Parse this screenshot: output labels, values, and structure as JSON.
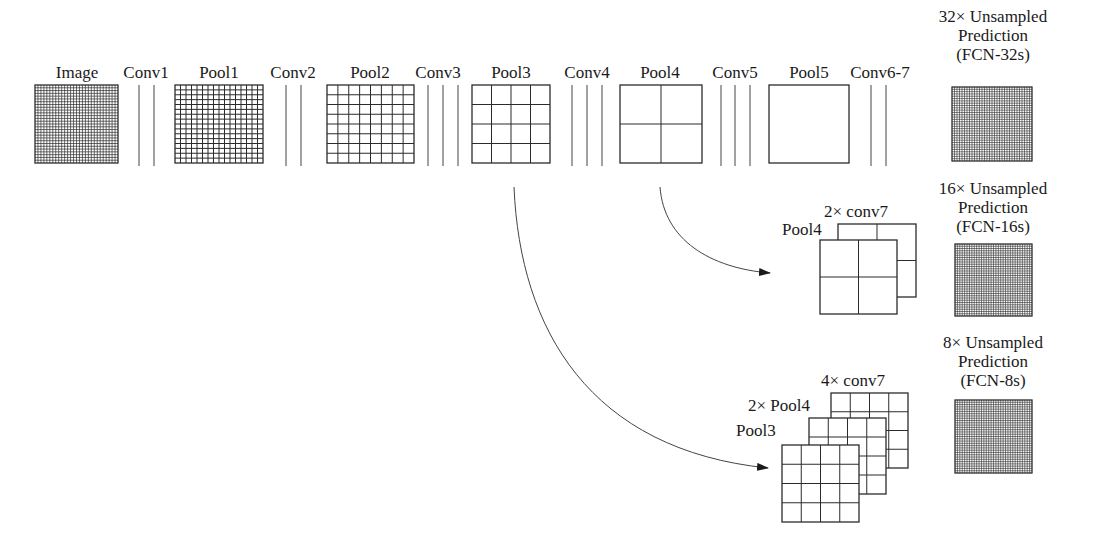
{
  "figure": {
    "colors": {
      "stroke": "#2b2b2b",
      "dense_fill": "#555555",
      "background": "#ffffff"
    }
  },
  "pipeline": {
    "stages": [
      {
        "label": "Image",
        "kind": "map",
        "grid": 28,
        "x": 35,
        "w": 83
      },
      {
        "label": "Conv1",
        "kind": "conv",
        "lines": [
          139,
          154
        ]
      },
      {
        "label": "Pool1",
        "kind": "map",
        "grid": 16,
        "x": 175,
        "w": 88
      },
      {
        "label": "Conv2",
        "kind": "conv",
        "lines": [
          286,
          301
        ]
      },
      {
        "label": "Pool2",
        "kind": "map",
        "grid": 8,
        "x": 327,
        "w": 87
      },
      {
        "label": "Conv3",
        "kind": "conv",
        "lines": [
          428,
          443,
          458
        ]
      },
      {
        "label": "Pool3",
        "kind": "map",
        "grid": 4,
        "x": 472,
        "w": 78
      },
      {
        "label": "Conv4",
        "kind": "conv",
        "lines": [
          572,
          587,
          602
        ]
      },
      {
        "label": "Pool4",
        "kind": "map",
        "grid": 2,
        "x": 620,
        "w": 82
      },
      {
        "label": "Conv5",
        "kind": "conv",
        "lines": [
          721,
          735,
          750
        ]
      },
      {
        "label": "Pool5",
        "kind": "map",
        "grid": 1,
        "x": 769,
        "w": 80
      },
      {
        "label": "Conv6-7",
        "kind": "conv",
        "lines": [
          871,
          886
        ]
      }
    ]
  },
  "predictions": [
    {
      "lines": [
        "32× Unsampled",
        "Prediction",
        "(FCN-32s)"
      ],
      "box": {
        "x": 952,
        "y": 87,
        "w": 80,
        "h": 74
      }
    },
    {
      "lines": [
        "16× Unsampled",
        "Prediction",
        "(FCN-16s)"
      ],
      "box": {
        "x": 955,
        "y": 244,
        "w": 77,
        "h": 72
      }
    },
    {
      "lines": [
        "8× Unsampled",
        "Prediction",
        "(FCN-8s)"
      ],
      "box": {
        "x": 955,
        "y": 400,
        "w": 77,
        "h": 73
      }
    }
  ],
  "fusion_16s": {
    "layers": [
      {
        "label": "2× conv7",
        "grid": 2,
        "x": 838,
        "y": 224,
        "w": 78,
        "h": 73
      },
      {
        "label": "Pool4",
        "grid": 2,
        "x": 820,
        "y": 240,
        "w": 77,
        "h": 74
      }
    ]
  },
  "fusion_8s": {
    "layers": [
      {
        "label": "4× conv7",
        "grid": 4,
        "x": 831,
        "y": 393,
        "w": 77,
        "h": 75
      },
      {
        "label": "2× Pool4",
        "grid": 4,
        "x": 809,
        "y": 418,
        "w": 77,
        "h": 76
      },
      {
        "label": "Pool3",
        "grid": 4,
        "x": 782,
        "y": 445,
        "w": 77,
        "h": 77
      }
    ]
  },
  "arrows": [
    {
      "from": "Pool4",
      "to": "fusion_16s",
      "path": "M660,187 C664,240 710,268 770,273"
    },
    {
      "from": "Pool3",
      "to": "fusion_8s",
      "path": "M514,187 C520,330 590,450 768,468"
    }
  ]
}
